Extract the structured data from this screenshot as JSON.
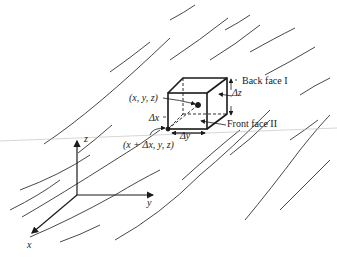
{
  "diagram": {
    "labels": {
      "point_xyz": "(x, y, z)",
      "point_xdx": "(x + Δx, y, z)",
      "dx": "Δx",
      "dy": "Δy",
      "dz": "Δz",
      "back_face": "Back face I",
      "front_face": "Front face II"
    },
    "axes": {
      "x": "x",
      "y": "y",
      "z": "z"
    },
    "colors": {
      "line": "#1a1a1a",
      "streamline": "#333333",
      "background": "#ffffff"
    }
  }
}
